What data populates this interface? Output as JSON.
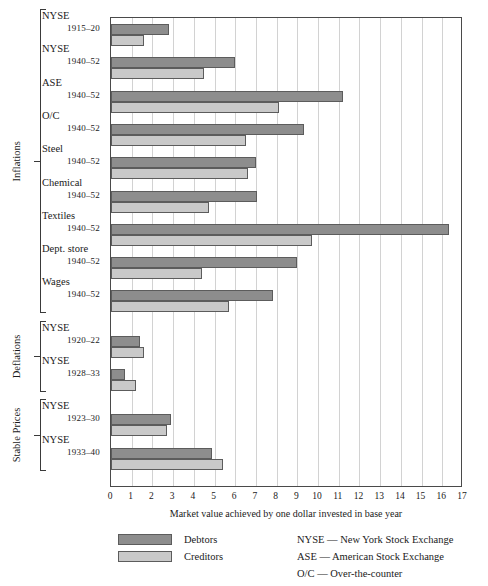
{
  "chart_data": {
    "type": "bar",
    "orientation": "horizontal",
    "title": "",
    "xlabel": "Market value achieved by one dollar invested in base year",
    "ylabel": "",
    "xlim": [
      0,
      17
    ],
    "xticks": [
      0,
      1,
      2,
      3,
      4,
      5,
      6,
      7,
      8,
      9,
      10,
      11,
      12,
      13,
      14,
      15,
      16,
      17
    ],
    "grid": true,
    "legend_position": "bottom-left",
    "series": [
      {
        "name": "Debtors",
        "color": "#8d8d8d",
        "values": [
          2.8,
          6.0,
          11.2,
          9.3,
          7.0,
          7.05,
          16.3,
          9.0,
          7.8,
          1.4,
          0.7,
          2.9,
          4.9
        ]
      },
      {
        "name": "Creditors",
        "color": "#c9c9c9",
        "values": [
          1.6,
          4.5,
          8.1,
          6.5,
          6.6,
          4.75,
          9.7,
          4.4,
          5.7,
          1.6,
          1.2,
          2.7,
          5.4
        ]
      }
    ],
    "categories": [
      {
        "name": "NYSE",
        "years": "1915–20",
        "group": "Inflations"
      },
      {
        "name": "NYSE",
        "years": "1940–52",
        "group": "Inflations"
      },
      {
        "name": "ASE",
        "years": "1940–52",
        "group": "Inflations"
      },
      {
        "name": "O/C",
        "years": "1940–52",
        "group": "Inflations"
      },
      {
        "name": "Steel",
        "years": "1940–52",
        "group": "Inflations"
      },
      {
        "name": "Chemical",
        "years": "1940–52",
        "group": "Inflations"
      },
      {
        "name": "Textiles",
        "years": "1940–52",
        "group": "Inflations"
      },
      {
        "name": "Dept. store",
        "years": "1940–52",
        "group": "Inflations"
      },
      {
        "name": "Wages",
        "years": "1940–52",
        "group": "Inflations"
      },
      {
        "name": "NYSE",
        "years": "1920–22",
        "group": "Deflations"
      },
      {
        "name": "NYSE",
        "years": "1928–33",
        "group": "Deflations"
      },
      {
        "name": "NYSE",
        "years": "1923–30",
        "group": "Stable Prices"
      },
      {
        "name": "NYSE",
        "years": "1933–40",
        "group": "Stable Prices"
      }
    ],
    "groups": [
      {
        "label": "Inflations",
        "label_lines": [
          "Inflations"
        ],
        "first": 0,
        "last": 8
      },
      {
        "label": "Deflations",
        "label_lines": [
          "Deflations"
        ],
        "first": 9,
        "last": 10
      },
      {
        "label": "Stable Prices",
        "label_lines": [
          "Stable",
          "Prices"
        ],
        "first": 11,
        "last": 12
      }
    ]
  },
  "legend": {
    "items": [
      {
        "label": "Debtors",
        "color": "#8d8d8d"
      },
      {
        "label": "Creditors",
        "color": "#c9c9c9"
      }
    ]
  },
  "notes": [
    "NYSE — New York Stock Exchange",
    "ASE — American Stock Exchange",
    "O/C — Over-the-counter"
  ],
  "axis": {
    "caption": "Market value achieved by one dollar invested in base year"
  }
}
